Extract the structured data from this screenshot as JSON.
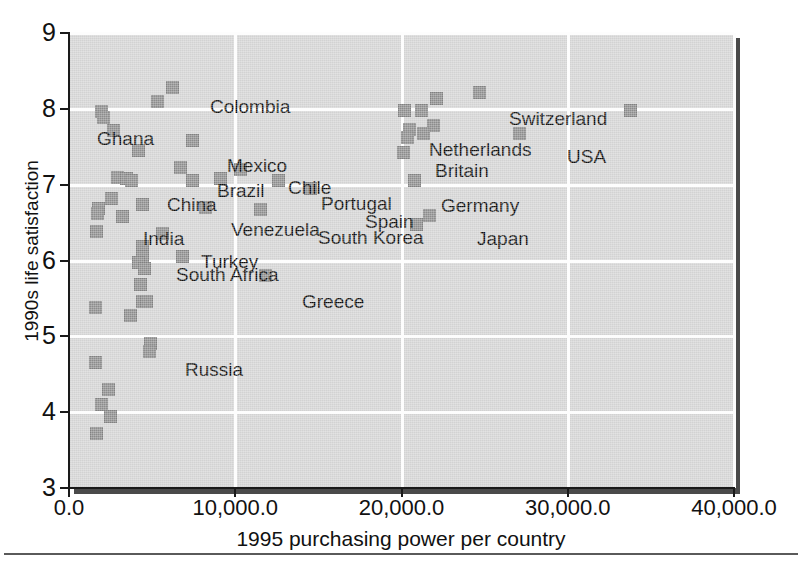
{
  "chart_data": {
    "type": "scatter",
    "title": "",
    "xlabel": "1995 purchasing power per country",
    "ylabel": "1990s life satisfaction",
    "xlim": [
      0,
      40000
    ],
    "ylim": [
      3,
      9
    ],
    "xticks": [
      "0.0",
      "10,000.0",
      "20,000.0",
      "30,000.0",
      "40,000.0"
    ],
    "xtick_values": [
      0,
      10000,
      20000,
      30000,
      40000
    ],
    "yticks": [
      "3",
      "4",
      "5",
      "6",
      "7",
      "8",
      "9"
    ],
    "ytick_values": [
      3,
      4,
      5,
      6,
      7,
      8,
      9
    ],
    "grid": true,
    "legend": "none",
    "marker_color": "#8c8c8c",
    "panel_color": "#d2d2d2",
    "gridline_color": "#fdfdfd",
    "points": [
      {
        "label": "Colombia",
        "x": 6200,
        "y": 8.28
      },
      {
        "label": "",
        "x": 5300,
        "y": 8.1
      },
      {
        "label": "Ghana",
        "x": 1950,
        "y": 7.97
      },
      {
        "label": "",
        "x": 2050,
        "y": 7.88
      },
      {
        "label": "",
        "x": 2650,
        "y": 7.72
      },
      {
        "label": "Mexico",
        "x": 7400,
        "y": 7.58
      },
      {
        "label": "",
        "x": 4200,
        "y": 7.45
      },
      {
        "label": "Brazil",
        "x": 6700,
        "y": 7.22
      },
      {
        "label": "Chile",
        "x": 10300,
        "y": 7.2
      },
      {
        "label": "China",
        "x": 2900,
        "y": 7.1
      },
      {
        "label": "",
        "x": 3450,
        "y": 7.08
      },
      {
        "label": "",
        "x": 3750,
        "y": 7.05
      },
      {
        "label": "",
        "x": 7450,
        "y": 7.05
      },
      {
        "label": "Portugal",
        "x": 12600,
        "y": 7.05
      },
      {
        "label": "",
        "x": 9100,
        "y": 7.08
      },
      {
        "label": "Spain",
        "x": 14500,
        "y": 6.95
      },
      {
        "label": "",
        "x": 2550,
        "y": 6.82
      },
      {
        "label": "India",
        "x": 1800,
        "y": 6.68
      },
      {
        "label": "",
        "x": 1700,
        "y": 6.62
      },
      {
        "label": "",
        "x": 4400,
        "y": 6.74
      },
      {
        "label": "Venezuela",
        "x": 8200,
        "y": 6.7
      },
      {
        "label": "South Korea",
        "x": 11500,
        "y": 6.67
      },
      {
        "label": "",
        "x": 3200,
        "y": 6.58
      },
      {
        "label": "",
        "x": 1650,
        "y": 6.38
      },
      {
        "label": "Turkey",
        "x": 5600,
        "y": 6.35
      },
      {
        "label": "South Africa",
        "x": 4400,
        "y": 6.18
      },
      {
        "label": "",
        "x": 4450,
        "y": 6.05
      },
      {
        "label": "",
        "x": 6800,
        "y": 6.05
      },
      {
        "label": "",
        "x": 4200,
        "y": 5.98
      },
      {
        "label": "",
        "x": 4550,
        "y": 5.9
      },
      {
        "label": "Greece",
        "x": 11800,
        "y": 5.8
      },
      {
        "label": "",
        "x": 4300,
        "y": 5.68
      },
      {
        "label": "",
        "x": 4400,
        "y": 5.46
      },
      {
        "label": "",
        "x": 4650,
        "y": 5.46
      },
      {
        "label": "",
        "x": 1600,
        "y": 5.38
      },
      {
        "label": "",
        "x": 3700,
        "y": 5.28
      },
      {
        "label": "Russia",
        "x": 4900,
        "y": 4.9
      },
      {
        "label": "",
        "x": 4850,
        "y": 4.8
      },
      {
        "label": "",
        "x": 1600,
        "y": 4.65
      },
      {
        "label": "",
        "x": 2400,
        "y": 4.3
      },
      {
        "label": "",
        "x": 1950,
        "y": 4.1
      },
      {
        "label": "",
        "x": 2500,
        "y": 3.94
      },
      {
        "label": "",
        "x": 1650,
        "y": 3.72
      },
      {
        "label": "Switzerland",
        "x": 24700,
        "y": 8.21
      },
      {
        "label": "",
        "x": 22100,
        "y": 8.13
      },
      {
        "label": "Netherlands",
        "x": 21200,
        "y": 7.98
      },
      {
        "label": "",
        "x": 20200,
        "y": 7.98
      },
      {
        "label": "",
        "x": 21900,
        "y": 7.78
      },
      {
        "label": "Britain",
        "x": 20500,
        "y": 7.73
      },
      {
        "label": "",
        "x": 21300,
        "y": 7.68
      },
      {
        "label": "",
        "x": 20350,
        "y": 7.62
      },
      {
        "label": "USA",
        "x": 27100,
        "y": 7.68
      },
      {
        "label": "",
        "x": 20100,
        "y": 7.42
      },
      {
        "label": "Germany",
        "x": 20800,
        "y": 7.05
      },
      {
        "label": "Japan",
        "x": 21700,
        "y": 6.6
      },
      {
        "label": "",
        "x": 20900,
        "y": 6.48
      },
      {
        "label": "",
        "x": 33800,
        "y": 7.98
      }
    ],
    "annotations": [
      {
        "text": "Colombia",
        "x_px": 141,
        "y_px": 64
      },
      {
        "text": "Ghana",
        "x_px": 28,
        "y_px": 96
      },
      {
        "text": "Mexico",
        "x_px": 158,
        "y_px": 123
      },
      {
        "text": "Brazil",
        "x_px": 148,
        "y_px": 148
      },
      {
        "text": "Chile",
        "x_px": 219,
        "y_px": 145
      },
      {
        "text": "China",
        "x_px": 98,
        "y_px": 162
      },
      {
        "text": "Portugal",
        "x_px": 252,
        "y_px": 161
      },
      {
        "text": "Spain",
        "x_px": 296,
        "y_px": 179
      },
      {
        "text": "India",
        "x_px": 74,
        "y_px": 196
      },
      {
        "text": "Venezuela",
        "x_px": 162,
        "y_px": 187
      },
      {
        "text": "South Korea",
        "x_px": 249,
        "y_px": 195
      },
      {
        "text": "Turkey",
        "x_px": 132,
        "y_px": 219
      },
      {
        "text": "South Africa",
        "x_px": 107,
        "y_px": 232
      },
      {
        "text": "Greece",
        "x_px": 233,
        "y_px": 259
      },
      {
        "text": "Russia",
        "x_px": 116,
        "y_px": 327
      },
      {
        "text": "Switzerland",
        "x_px": 440,
        "y_px": 76
      },
      {
        "text": "Netherlands",
        "x_px": 360,
        "y_px": 107
      },
      {
        "text": "Britain",
        "x_px": 366,
        "y_px": 128
      },
      {
        "text": "USA",
        "x_px": 498,
        "y_px": 114
      },
      {
        "text": "Germany",
        "x_px": 372,
        "y_px": 163
      },
      {
        "text": "Japan",
        "x_px": 408,
        "y_px": 196
      }
    ]
  },
  "figure": {
    "axis": {
      "x_title": "1995 purchasing power per country",
      "y_title": "1990s life satisfaction",
      "x_ticks": [
        "0.0",
        "10,000.0",
        "20,000.0",
        "30,000.0",
        "40,000.0"
      ],
      "y_ticks": [
        "9",
        "8",
        "7",
        "6",
        "5",
        "4",
        "3"
      ]
    }
  }
}
